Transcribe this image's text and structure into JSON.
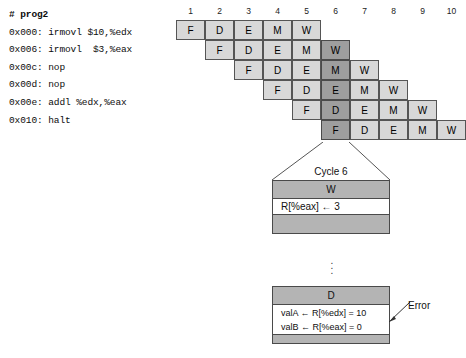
{
  "code": {
    "title": "# prog2",
    "lines": [
      "0x000: irmovl $10,%edx",
      "0x006: irmovl  $3,%eax",
      "0x00c: nop",
      "0x00d: nop",
      "0x00e: addl %edx,%eax",
      "0x010: halt"
    ]
  },
  "pipeline": {
    "columns": [
      "1",
      "2",
      "3",
      "4",
      "5",
      "6",
      "7",
      "8",
      "9",
      "10"
    ],
    "highlight_column": 6,
    "rows": [
      {
        "start": 1,
        "stages": [
          "F",
          "D",
          "E",
          "M",
          "W"
        ]
      },
      {
        "start": 2,
        "stages": [
          "F",
          "D",
          "E",
          "M",
          "W"
        ]
      },
      {
        "start": 3,
        "stages": [
          "F",
          "D",
          "E",
          "M",
          "W"
        ]
      },
      {
        "start": 4,
        "stages": [
          "F",
          "D",
          "E",
          "M",
          "W"
        ]
      },
      {
        "start": 5,
        "stages": [
          "F",
          "D",
          "E",
          "M",
          "W"
        ]
      },
      {
        "start": 6,
        "stages": [
          "F",
          "D",
          "E",
          "M",
          "W"
        ]
      }
    ]
  },
  "detail": {
    "cycle_label": "Cycle 6",
    "write_box": {
      "stage": "W",
      "body": "R[%eax] ← 3"
    },
    "ellipsis": "⋮",
    "decode_box": {
      "stage": "D",
      "body_lines": [
        "valA ← R[%edx] = 10",
        "valB ← R[%eax] = 0"
      ]
    },
    "annotation": "Error"
  },
  "colors": {
    "cell_light": "#d8d8d8",
    "cell_dark": "#9e9e9e",
    "band_gray": "#b4b4b4",
    "border": "#4a4a4a"
  },
  "caption": ""
}
